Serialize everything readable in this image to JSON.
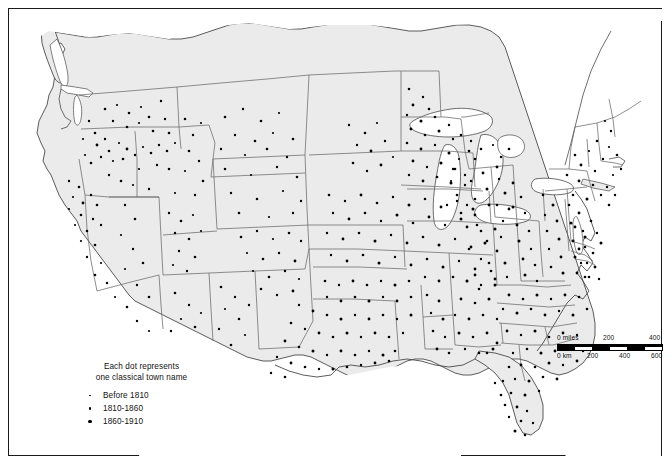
{
  "map": {
    "title": "Classical town names in the United States",
    "region": "United States",
    "landmass_fill": "#ebebeb",
    "water_fill": "#ffffff",
    "boundary_color": "#555555",
    "dot_color": "#000000",
    "frame_color": "#1a1a1a"
  },
  "legend": {
    "title_line1": "Each dot represents",
    "title_line2": "one classical town name",
    "entries": [
      {
        "label": "Before 1810",
        "size": "small",
        "icon": "dot-icon"
      },
      {
        "label": "1810-1860",
        "size": "medium",
        "icon": "dot-icon"
      },
      {
        "label": "1860-1910",
        "size": "large",
        "icon": "dot-icon"
      }
    ]
  },
  "scalebar": {
    "miles_labels": [
      "0 miles",
      "200",
      "400"
    ],
    "km_labels": [
      "0 km",
      "200",
      "400",
      "600"
    ],
    "miles_max": 400,
    "km_max": 600
  }
}
